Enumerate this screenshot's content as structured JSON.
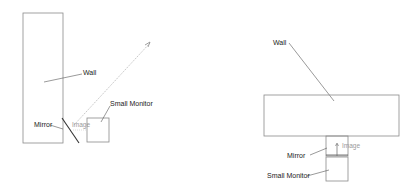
{
  "diagrams": [
    {
      "view": "side",
      "labels": {
        "wall": "Wall",
        "mirror": "Mirror",
        "image": "Image",
        "small_monitor": "Small Monitor"
      }
    },
    {
      "view": "top",
      "labels": {
        "wall": "Wall",
        "mirror": "Mirror",
        "image": "Image",
        "small_monitor": "Small Monitor"
      }
    }
  ],
  "colors": {
    "outline": "#8a8a8a",
    "leader": "#555555",
    "sightline": "#b8b8b8",
    "mirror": "#333333"
  }
}
